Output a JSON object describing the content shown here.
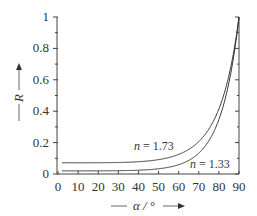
{
  "chart_data": {
    "type": "line",
    "title": "",
    "xlabel": "α / °",
    "ylabel": "R",
    "xlim": [
      0,
      90
    ],
    "ylim": [
      0,
      1
    ],
    "x_ticks": [
      "0",
      "10",
      "20",
      "30",
      "40",
      "50",
      "60",
      "70",
      "80",
      "90"
    ],
    "y_ticks": [
      "0",
      "0.2",
      "0.4",
      "0.6",
      "0.8",
      "1"
    ],
    "grid": false,
    "legend": "inline labels",
    "x": [
      0,
      10,
      20,
      30,
      40,
      50,
      60,
      65,
      70,
      75,
      80,
      85,
      88,
      90
    ],
    "series": [
      {
        "name": "n = 1.73",
        "values": [
          0.072,
          0.072,
          0.072,
          0.073,
          0.076,
          0.084,
          0.103,
          0.123,
          0.155,
          0.212,
          0.317,
          0.529,
          0.75,
          1.0
        ]
      },
      {
        "name": "n = 1.33",
        "values": [
          0.02,
          0.02,
          0.021,
          0.022,
          0.025,
          0.033,
          0.058,
          0.082,
          0.122,
          0.188,
          0.307,
          0.538,
          0.76,
          1.0
        ]
      }
    ],
    "annotations": [
      {
        "text": "n = 1.73",
        "x": 62,
        "y": 0.17
      },
      {
        "text": "n = 1.33",
        "x": 80,
        "y": 0.03
      }
    ]
  },
  "labels": {
    "ylabel_main": "R",
    "xlabel_main": "α / °",
    "curve1": "n = 1.73",
    "curve2": "n = 1.33"
  }
}
